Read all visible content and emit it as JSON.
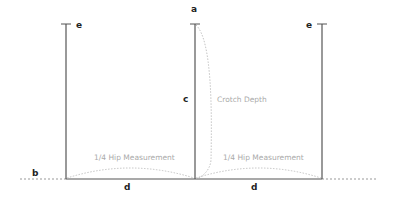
{
  "diagram": {
    "points": {
      "a": "a",
      "b": "b",
      "c": "c",
      "d_left": "d",
      "d_right": "d",
      "e_left": "e",
      "e_right": "e"
    },
    "measurements": {
      "crotch_depth": "Crotch Depth",
      "hip_left": "1/4 Hip Measurement",
      "hip_right": "1/4 Hip Measurement"
    },
    "colors": {
      "solid_line": "#555555",
      "dotted_line": "#999999",
      "label": "#222222",
      "annotation": "#aaaaaa"
    }
  }
}
